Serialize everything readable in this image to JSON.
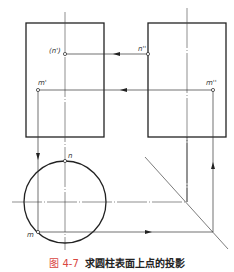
{
  "figure": {
    "number": "图 4-7",
    "title": "求圆柱表面上点的投影",
    "accent_color": "#d9463f"
  },
  "labels": {
    "n_front": "(n')",
    "n_side": "n''",
    "m_front": "m'",
    "m_side": "m''",
    "n_top": "n",
    "m_top": "m"
  },
  "geometry": {
    "front_view": {
      "x": 26,
      "y": 23,
      "w": 78,
      "h": 114
    },
    "side_view": {
      "x": 148,
      "y": 23,
      "w": 78,
      "h": 114
    },
    "top_view_circle": {
      "cx": 65,
      "cy": 202,
      "r": 41
    },
    "points": {
      "n_front": [
        65,
        54
      ],
      "n_side": [
        148,
        54
      ],
      "m_front": [
        38,
        90
      ],
      "m_side": [
        213,
        90
      ],
      "n_top": [
        65,
        161
      ],
      "m_top": [
        38,
        232
      ]
    }
  }
}
